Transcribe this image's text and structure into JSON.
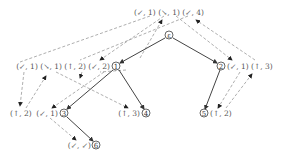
{
  "diagram": {
    "type": "tree-with-annotations",
    "nodes": [
      {
        "id": "root",
        "label": "ε",
        "x": 169,
        "y": 35
      },
      {
        "id": "n1",
        "label": "1",
        "x": 116,
        "y": 66
      },
      {
        "id": "n2",
        "label": "2",
        "x": 221,
        "y": 66
      },
      {
        "id": "n3",
        "label": "3",
        "x": 64,
        "y": 113
      },
      {
        "id": "n4",
        "label": "4",
        "x": 146,
        "y": 113
      },
      {
        "id": "n5",
        "label": "5",
        "x": 204,
        "y": 113
      },
      {
        "id": "n6",
        "label": "6",
        "x": 96,
        "y": 145
      }
    ],
    "edges": [
      [
        "root",
        "n1"
      ],
      [
        "root",
        "n2"
      ],
      [
        "n1",
        "n3"
      ],
      [
        "n1",
        "n4"
      ],
      [
        "n2",
        "n5"
      ],
      [
        "n3",
        "n6"
      ]
    ],
    "annotations": {
      "root": "(↙, 1) (↘, 1) (↙, 4)",
      "n1": "(↙, 1) (↘, 1) (↑, 2) (↙, 2)",
      "n2": "(↙, 1) (↑, 3)",
      "n3_left_a": "(↑, 2)",
      "n3_left_b": "(↙, 1)",
      "n4": "(↑, 3)",
      "n5": "(↑, 2)",
      "n6": "(↙, ↙)"
    }
  }
}
